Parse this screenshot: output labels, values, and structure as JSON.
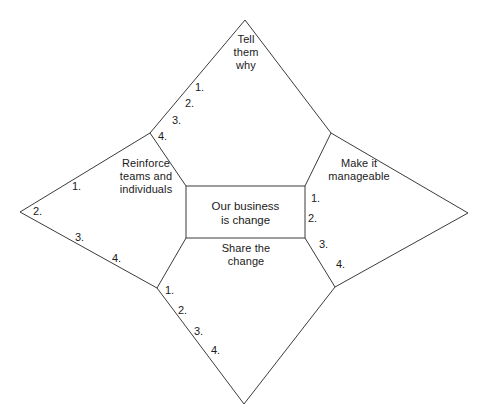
{
  "diagram": {
    "type": "four-point-star",
    "center": {
      "label": "Our business\nis change",
      "shape": "rectangle"
    },
    "quadrants": [
      {
        "id": "top",
        "label": "Tell\nthem\nwhy",
        "items": [
          "1.",
          "2.",
          "3.",
          "4."
        ]
      },
      {
        "id": "right",
        "label": "Make it\nmanageable",
        "items": [
          "1.",
          "2.",
          "3.",
          "4."
        ]
      },
      {
        "id": "bottom",
        "label": "Share the\nchange",
        "items": [
          "1.",
          "2.",
          "3.",
          "4."
        ]
      },
      {
        "id": "left",
        "label": "Reinforce\nteams and\nindividuals",
        "items": [
          "1.",
          "2.",
          "3.",
          "4."
        ]
      }
    ],
    "colors": {
      "stroke": "#3b3b3b",
      "text": "#1a1a1a",
      "background": "#ffffff"
    }
  }
}
